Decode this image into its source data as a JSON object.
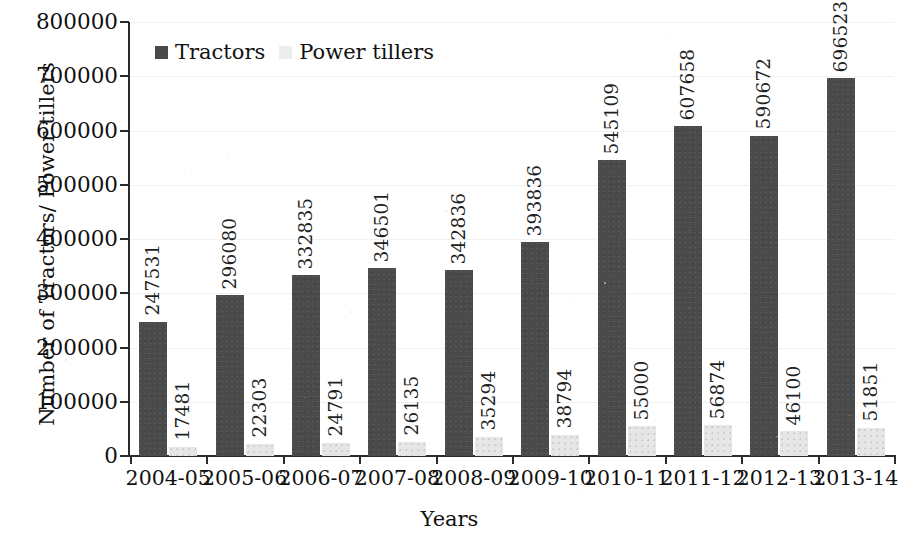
{
  "chart_data": {
    "type": "bar",
    "title": "",
    "xlabel": "Years",
    "ylabel": "Number of Tractors/ Power tillers",
    "categories": [
      "2004-05",
      "2005-06",
      "2006-07",
      "2007-08",
      "2008-09",
      "2009-10",
      "2010-11",
      "2011-12",
      "2012-13",
      "2013-14"
    ],
    "series": [
      {
        "name": "Tractors",
        "color": "#4a4a4a",
        "values": [
          247531,
          296080,
          332835,
          346501,
          342836,
          393836,
          545109,
          607658,
          590672,
          696523
        ]
      },
      {
        "name": "Power tillers",
        "color": "#e6e6e6",
        "values": [
          17481,
          22303,
          24791,
          26135,
          35294,
          38794,
          55000,
          56874,
          46100,
          51851
        ]
      }
    ],
    "ylim": [
      0,
      800000
    ],
    "ytick_labels": [
      "0",
      "100000",
      "200000",
      "300000",
      "400000",
      "500000",
      "600000",
      "700000",
      "800000"
    ],
    "ytick_values": [
      0,
      100000,
      200000,
      300000,
      400000,
      500000,
      600000,
      700000,
      800000
    ],
    "grid": true,
    "legend_position": "top-left",
    "data_labels": true,
    "data_label_orientation": "vertical"
  },
  "legend": {
    "items": [
      {
        "label": "Tractors",
        "swatch": "dark-square-icon"
      },
      {
        "label": "Power tillers",
        "swatch": "light-square-icon"
      }
    ]
  },
  "axes": {
    "y_title": "Number of Tractors/ Power tillers",
    "x_title": "Years"
  }
}
